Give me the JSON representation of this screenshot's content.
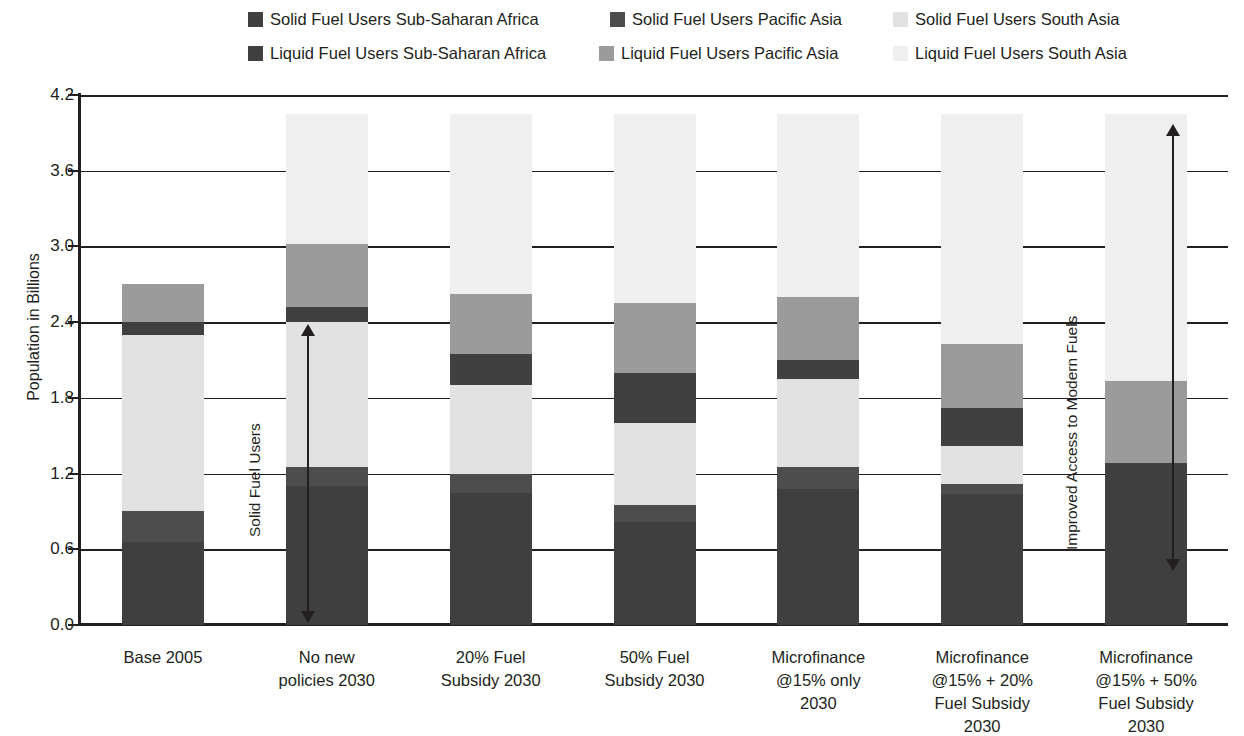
{
  "legend": {
    "items": [
      {
        "label": "Solid Fuel Users Sub-Saharan Africa",
        "color": "#3f3f3f"
      },
      {
        "label": "Solid Fuel Users Pacific Asia",
        "color": "#4d4d4d"
      },
      {
        "label": "Solid Fuel Users South Asia",
        "color": "#e2e2e2"
      },
      {
        "label": "Liquid Fuel Users Sub-Saharan Africa",
        "color": "#404040"
      },
      {
        "label": "Liquid Fuel Users Pacific Asia",
        "color": "#9b9b9b"
      },
      {
        "label": "Liquid Fuel Users South Asia",
        "color": "#efefef"
      }
    ]
  },
  "annotations": [
    {
      "name": "solid-fuel-users-annotation",
      "text": "Solid Fuel Users"
    },
    {
      "name": "improved-access-annotation",
      "text": "Improved Access to Modern Fuels"
    }
  ],
  "chart_data": {
    "type": "bar",
    "stacked": true,
    "title": "",
    "xlabel": "",
    "ylabel": "Population in Billions",
    "ylim": [
      0.0,
      4.2
    ],
    "yticks": [
      "0.0",
      "0.6",
      "1.2",
      "1.8",
      "2.4",
      "3.0",
      "3.6",
      "4.2"
    ],
    "grid": true,
    "legend_position": "top",
    "categories": [
      "Base 2005",
      "No new policies 2030",
      "20% Fuel Subsidy 2030",
      "50% Fuel Subsidy 2030",
      "Microfinance @15% only 2030",
      "Microfinance @15% + 20% Fuel Subsidy 2030",
      "Microfinance @15% + 50% Fuel Subsidy 2030"
    ],
    "category_lines": [
      [
        "Base 2005"
      ],
      [
        "No new",
        "policies 2030"
      ],
      [
        "20% Fuel",
        "Subsidy 2030"
      ],
      [
        "50% Fuel",
        "Subsidy 2030"
      ],
      [
        "Microfinance",
        "@15% only",
        "2030"
      ],
      [
        "Microfinance",
        "@15% + 20%",
        "Fuel Subsidy",
        "2030"
      ],
      [
        "Microfinance",
        "@15% + 50%",
        "Fuel Subsidy",
        "2030"
      ]
    ],
    "series": [
      {
        "name": "Solid Fuel Users Sub-Saharan Africa",
        "color": "#3f3f3f",
        "values": [
          0.66,
          1.1,
          1.05,
          0.82,
          1.08,
          1.04,
          0.58
        ]
      },
      {
        "name": "Solid Fuel Users Pacific Asia",
        "color": "#4d4d4d",
        "values": [
          0.24,
          0.15,
          0.15,
          0.13,
          0.17,
          0.08,
          0.0
        ]
      },
      {
        "name": "Solid Fuel Users South Asia",
        "color": "#e2e2e2",
        "values": [
          1.4,
          1.15,
          0.7,
          0.65,
          0.7,
          0.3,
          0.0
        ]
      },
      {
        "name": "Liquid Fuel Users Sub-Saharan Africa",
        "color": "#404040",
        "values": [
          0.1,
          0.12,
          0.25,
          0.4,
          0.15,
          0.3,
          0.7
        ]
      },
      {
        "name": "Liquid Fuel Users Pacific Asia",
        "color": "#9b9b9b",
        "values": [
          0.3,
          0.5,
          0.47,
          0.55,
          0.5,
          0.51,
          0.65
        ]
      },
      {
        "name": "Liquid Fuel Users South Asia",
        "color": "#efefef",
        "values": [
          0.0,
          1.03,
          1.43,
          1.5,
          1.45,
          1.82,
          2.12
        ]
      }
    ],
    "bar_totals": [
      2.7,
      4.05,
      4.05,
      4.05,
      4.05,
      4.05,
      4.05
    ]
  }
}
